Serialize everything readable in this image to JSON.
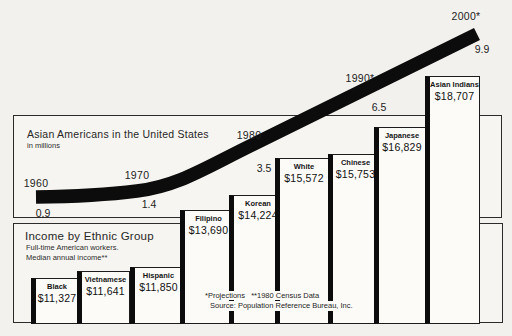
{
  "population_panel": {
    "title": "Asian Americans in the United States",
    "subtitle": "in millions"
  },
  "income_panel": {
    "title": "Income by Ethnic Group",
    "subtitle1": "Full-time American workers.",
    "subtitle2": "Median annual income**"
  },
  "footnotes": {
    "projections": "*Projections",
    "census": "**1980 Census Data",
    "source": "Source: Population Reference Bureau, Inc."
  },
  "colors": {
    "curve": "#0c0c0c",
    "bar_fill": "#fcfbf8",
    "line": "#2b2b2b",
    "background": "#f3f1ed"
  },
  "chart_data": [
    {
      "type": "line",
      "title": "Asian Americans in the United States",
      "ylabel": "in millions",
      "x": [
        1960,
        1970,
        1980,
        1990,
        2000
      ],
      "x_tick_labels": [
        "1960",
        "1970",
        "1980",
        "1990*",
        "2000*"
      ],
      "values": [
        0.9,
        1.4,
        3.5,
        6.5,
        9.9
      ],
      "annotation": "* projections; thick black band rising left to right",
      "milestones": [
        {
          "year_label": "1960",
          "value_label": "0.9",
          "yx": 36,
          "yy": 183,
          "vx": 43,
          "vy": 213
        },
        {
          "year_label": "1970",
          "value_label": "1.4",
          "yx": 137,
          "yy": 175,
          "vx": 149,
          "vy": 204
        },
        {
          "year_label": "1980",
          "value_label": "3.5",
          "yx": 249,
          "yy": 135,
          "vx": 264,
          "vy": 168
        },
        {
          "year_label": "1990*",
          "value_label": "6.5",
          "yx": 360,
          "yy": 78,
          "vx": 379,
          "vy": 107
        },
        {
          "year_label": "2000*",
          "value_label": "9.9",
          "yx": 466,
          "yy": 16,
          "vx": 482,
          "vy": 49
        }
      ],
      "curve_path": "M36,197 C80,196.5 110,194.5 137,191 C178,186 205,168 250,146 L477,34"
    },
    {
      "type": "bar",
      "title": "Income by Ethnic Group",
      "subtitle": "Full-time American workers. Median annual income**",
      "categories": [
        "Black",
        "Vietnamese",
        "Hispanic",
        "Filipino",
        "Korean",
        "White",
        "Chinese",
        "Japanese",
        "Asian Indians"
      ],
      "values": [
        11327,
        11641,
        11850,
        13690,
        14224,
        15572,
        15753,
        16829,
        18707
      ],
      "value_labels": [
        "$11,327",
        "$11,641",
        "$11,850",
        "$13,690",
        "$14,224",
        "$15,572",
        "$15,753",
        "$16,829",
        "$18,707"
      ],
      "source": "1980 Census Data, Population Reference Bureau, Inc.",
      "bars": [
        {
          "name": "Black",
          "value": "$11,327",
          "x": 31,
          "w": 48,
          "top": 278
        },
        {
          "name": "Vietnamese",
          "value": "$11,641",
          "x": 77,
          "w": 53,
          "top": 271
        },
        {
          "name": "Hispanic",
          "value": "$11,850",
          "x": 130,
          "w": 53,
          "top": 267
        },
        {
          "name": "Filipino",
          "value": "$13,690",
          "x": 180,
          "w": 53,
          "top": 210
        },
        {
          "name": "Korean",
          "value": "$14,224",
          "x": 229,
          "w": 54,
          "top": 195
        },
        {
          "name": "White",
          "value": "$15,572",
          "x": 275,
          "w": 54,
          "top": 158
        },
        {
          "name": "Chinese",
          "value": "$15,753",
          "x": 328,
          "w": 51,
          "top": 154
        },
        {
          "name": "Japanese",
          "value": "$16,829",
          "x": 374,
          "w": 52,
          "top": 127
        },
        {
          "name": "Asian Indians",
          "value": "$18,707",
          "x": 425,
          "w": 55,
          "top": 76
        }
      ],
      "baseline_y": 324
    }
  ]
}
